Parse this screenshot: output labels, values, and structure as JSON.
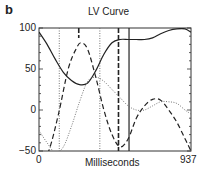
{
  "panel_label": "b",
  "chart_data": {
    "type": "line",
    "title": "LV Curve",
    "xlabel": "Milliseconds",
    "ylabel": "",
    "xlim": [
      0,
      937
    ],
    "ylim": [
      -50,
      100
    ],
    "x_ticks": [
      "0",
      "937"
    ],
    "y_ticks": [
      "100",
      "50",
      "0",
      "−50"
    ],
    "grid": false,
    "legend": null,
    "series": [
      {
        "name": "solid",
        "style": "solid",
        "x": [
          0,
          50,
          100,
          150,
          200,
          250,
          300,
          350,
          400,
          450,
          500,
          550,
          600,
          650,
          700,
          750,
          800,
          850,
          900,
          937
        ],
        "values": [
          95,
          80,
          62,
          46,
          36,
          31,
          33,
          48,
          68,
          82,
          86,
          86,
          86,
          86,
          88,
          93,
          97,
          99,
          99,
          95
        ]
      },
      {
        "name": "dashed",
        "style": "dashed",
        "x": [
          0,
          60,
          120,
          180,
          230,
          260,
          300,
          350,
          400,
          450,
          500,
          550,
          600,
          650,
          700,
          750,
          800,
          850,
          900,
          937
        ],
        "values": [
          -70,
          -50,
          -5,
          50,
          75,
          82,
          74,
          40,
          0,
          -30,
          -45,
          -35,
          -10,
          5,
          13,
          12,
          0,
          -15,
          -35,
          -50
        ]
      },
      {
        "name": "dotted",
        "style": "dotted",
        "x": [
          0,
          50,
          100,
          150,
          200,
          250,
          300,
          350,
          400,
          450,
          500,
          550,
          600,
          650,
          700,
          750,
          800,
          850,
          900,
          937
        ],
        "values": [
          -25,
          -40,
          -52,
          -45,
          -20,
          10,
          35,
          40,
          35,
          25,
          15,
          5,
          0,
          0,
          5,
          10,
          10,
          8,
          0,
          -5
        ]
      }
    ],
    "vertical_markers": [
      {
        "x": 125,
        "style": "dotted"
      },
      {
        "x": 245,
        "style": "dashed-thick",
        "top_only": true
      },
      {
        "x": 375,
        "style": "dotted"
      },
      {
        "x": 490,
        "style": "dashed-thick"
      },
      {
        "x": 555,
        "style": "solid"
      }
    ]
  }
}
